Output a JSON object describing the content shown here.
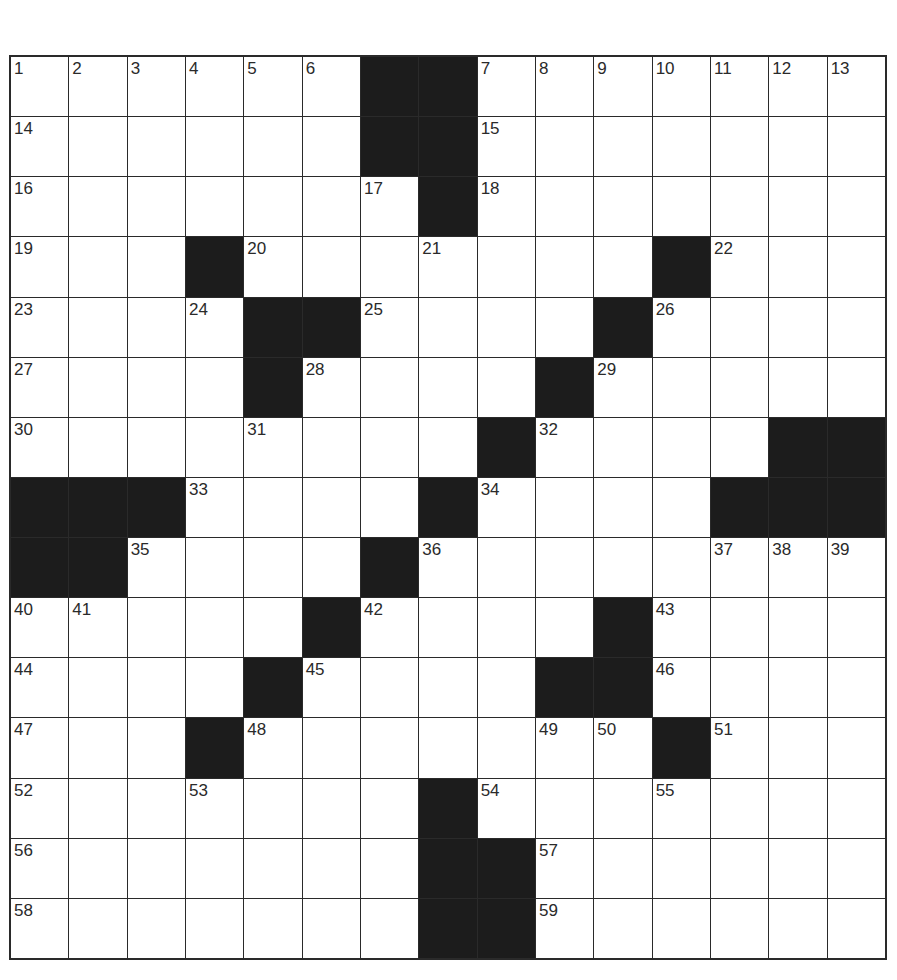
{
  "puzzle": {
    "size": {
      "rows": 15,
      "cols": 15
    },
    "colors": {
      "block": "#1c1c1c",
      "cell": "#ffffff",
      "line": "#2a2a2a"
    },
    "layout": [
      "......##.......",
      "......##.......",
      ".......#.......",
      "...#.......#...",
      "....##....#....",
      "....#....#.....",
      "........#....##",
      "###....#....###",
      "##....#........",
      ".....#....#....",
      "....#....##....",
      "...#.......#...",
      ".......#.......",
      ".......##......",
      ".......##......"
    ],
    "numbers": [
      {
        "r": 0,
        "c": 0,
        "n": "1"
      },
      {
        "r": 0,
        "c": 1,
        "n": "2"
      },
      {
        "r": 0,
        "c": 2,
        "n": "3"
      },
      {
        "r": 0,
        "c": 3,
        "n": "4"
      },
      {
        "r": 0,
        "c": 4,
        "n": "5"
      },
      {
        "r": 0,
        "c": 5,
        "n": "6"
      },
      {
        "r": 0,
        "c": 8,
        "n": "7"
      },
      {
        "r": 0,
        "c": 9,
        "n": "8"
      },
      {
        "r": 0,
        "c": 10,
        "n": "9"
      },
      {
        "r": 0,
        "c": 11,
        "n": "10"
      },
      {
        "r": 0,
        "c": 12,
        "n": "11"
      },
      {
        "r": 0,
        "c": 13,
        "n": "12"
      },
      {
        "r": 0,
        "c": 14,
        "n": "13"
      },
      {
        "r": 1,
        "c": 0,
        "n": "14"
      },
      {
        "r": 1,
        "c": 8,
        "n": "15"
      },
      {
        "r": 2,
        "c": 0,
        "n": "16"
      },
      {
        "r": 2,
        "c": 6,
        "n": "17"
      },
      {
        "r": 2,
        "c": 8,
        "n": "18"
      },
      {
        "r": 3,
        "c": 0,
        "n": "19"
      },
      {
        "r": 3,
        "c": 4,
        "n": "20"
      },
      {
        "r": 3,
        "c": 7,
        "n": "21"
      },
      {
        "r": 3,
        "c": 12,
        "n": "22"
      },
      {
        "r": 4,
        "c": 0,
        "n": "23"
      },
      {
        "r": 4,
        "c": 3,
        "n": "24"
      },
      {
        "r": 4,
        "c": 6,
        "n": "25"
      },
      {
        "r": 4,
        "c": 11,
        "n": "26"
      },
      {
        "r": 5,
        "c": 0,
        "n": "27"
      },
      {
        "r": 5,
        "c": 5,
        "n": "28"
      },
      {
        "r": 5,
        "c": 10,
        "n": "29"
      },
      {
        "r": 6,
        "c": 0,
        "n": "30"
      },
      {
        "r": 6,
        "c": 4,
        "n": "31"
      },
      {
        "r": 6,
        "c": 9,
        "n": "32"
      },
      {
        "r": 7,
        "c": 3,
        "n": "33"
      },
      {
        "r": 7,
        "c": 8,
        "n": "34"
      },
      {
        "r": 8,
        "c": 2,
        "n": "35"
      },
      {
        "r": 8,
        "c": 7,
        "n": "36"
      },
      {
        "r": 8,
        "c": 12,
        "n": "37"
      },
      {
        "r": 8,
        "c": 13,
        "n": "38"
      },
      {
        "r": 8,
        "c": 14,
        "n": "39"
      },
      {
        "r": 9,
        "c": 0,
        "n": "40"
      },
      {
        "r": 9,
        "c": 1,
        "n": "41"
      },
      {
        "r": 9,
        "c": 6,
        "n": "42"
      },
      {
        "r": 9,
        "c": 11,
        "n": "43"
      },
      {
        "r": 10,
        "c": 0,
        "n": "44"
      },
      {
        "r": 10,
        "c": 5,
        "n": "45"
      },
      {
        "r": 10,
        "c": 11,
        "n": "46"
      },
      {
        "r": 11,
        "c": 0,
        "n": "47"
      },
      {
        "r": 11,
        "c": 4,
        "n": "48"
      },
      {
        "r": 11,
        "c": 9,
        "n": "49"
      },
      {
        "r": 11,
        "c": 10,
        "n": "50"
      },
      {
        "r": 11,
        "c": 12,
        "n": "51"
      },
      {
        "r": 12,
        "c": 0,
        "n": "52"
      },
      {
        "r": 12,
        "c": 3,
        "n": "53"
      },
      {
        "r": 12,
        "c": 8,
        "n": "54"
      },
      {
        "r": 12,
        "c": 11,
        "n": "55"
      },
      {
        "r": 13,
        "c": 0,
        "n": "56"
      },
      {
        "r": 13,
        "c": 9,
        "n": "57"
      },
      {
        "r": 14,
        "c": 0,
        "n": "58"
      },
      {
        "r": 14,
        "c": 9,
        "n": "59"
      }
    ]
  }
}
